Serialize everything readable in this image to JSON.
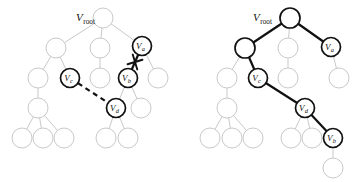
{
  "figure": {
    "title": "",
    "background_color": "#ffffff",
    "faint_node_color": "#c9c9c9",
    "bold_node_color": "#111111",
    "panels": [
      {
        "id": "left-panel",
        "name": "before-reconnection-tree",
        "root_label": "V",
        "root_sub": "root",
        "root_label_x": 76,
        "root_label_y": 21,
        "nodes": [
          {
            "id": "L-root",
            "x": 103,
            "y": 18,
            "r": 10,
            "style": "faint",
            "label": "",
            "sub": ""
          },
          {
            "id": "L-n1",
            "x": 56,
            "y": 48,
            "r": 10,
            "style": "faint",
            "label": "",
            "sub": ""
          },
          {
            "id": "L-n2",
            "x": 100,
            "y": 48,
            "r": 10,
            "style": "faint",
            "label": "",
            "sub": ""
          },
          {
            "id": "L-va",
            "x": 142,
            "y": 46,
            "r": 9.5,
            "style": "bold",
            "label": "V",
            "sub": "a"
          },
          {
            "id": "L-n3",
            "x": 38,
            "y": 78,
            "r": 10,
            "style": "faint",
            "label": "",
            "sub": ""
          },
          {
            "id": "L-vc",
            "x": 70,
            "y": 78,
            "r": 9.5,
            "style": "bold",
            "label": "V",
            "sub": "c"
          },
          {
            "id": "L-n4",
            "x": 100,
            "y": 78,
            "r": 10,
            "style": "faint",
            "label": "",
            "sub": ""
          },
          {
            "id": "L-vb",
            "x": 128,
            "y": 78,
            "r": 9.5,
            "style": "bold",
            "label": "V",
            "sub": "b"
          },
          {
            "id": "L-n5",
            "x": 158,
            "y": 78,
            "r": 10,
            "style": "faint",
            "label": "",
            "sub": ""
          },
          {
            "id": "L-n6",
            "x": 38,
            "y": 108,
            "r": 10,
            "style": "faint",
            "label": "",
            "sub": ""
          },
          {
            "id": "L-vd",
            "x": 116,
            "y": 108,
            "r": 9.5,
            "style": "bold",
            "label": "V",
            "sub": "d"
          },
          {
            "id": "L-n7",
            "x": 141,
            "y": 108,
            "r": 10,
            "style": "faint",
            "label": "",
            "sub": ""
          },
          {
            "id": "L-n8",
            "x": 22,
            "y": 138,
            "r": 10,
            "style": "faint",
            "label": "",
            "sub": ""
          },
          {
            "id": "L-n9",
            "x": 43,
            "y": 138,
            "r": 10,
            "style": "faint",
            "label": "",
            "sub": ""
          },
          {
            "id": "L-n10",
            "x": 64,
            "y": 138,
            "r": 10,
            "style": "faint",
            "label": "",
            "sub": ""
          },
          {
            "id": "L-n11",
            "x": 106,
            "y": 138,
            "r": 10,
            "style": "faint",
            "label": "",
            "sub": ""
          },
          {
            "id": "L-n12",
            "x": 128,
            "y": 138,
            "r": 10,
            "style": "faint",
            "label": "",
            "sub": ""
          }
        ],
        "edges": [
          {
            "from": "L-root",
            "to": "L-n1",
            "style": "faint"
          },
          {
            "from": "L-root",
            "to": "L-n2",
            "style": "faint"
          },
          {
            "from": "L-root",
            "to": "L-va",
            "style": "faint"
          },
          {
            "from": "L-n1",
            "to": "L-n3",
            "style": "faint"
          },
          {
            "from": "L-n1",
            "to": "L-vc",
            "style": "faint"
          },
          {
            "from": "L-n2",
            "to": "L-n4",
            "style": "faint"
          },
          {
            "from": "L-va",
            "to": "L-vb",
            "style": "bold"
          },
          {
            "from": "L-va",
            "to": "L-n5",
            "style": "faint"
          },
          {
            "from": "L-n3",
            "to": "L-n6",
            "style": "faint"
          },
          {
            "from": "L-vb",
            "to": "L-vd",
            "style": "faint"
          },
          {
            "from": "L-vb",
            "to": "L-n7",
            "style": "faint"
          },
          {
            "from": "L-n6",
            "to": "L-n8",
            "style": "faint"
          },
          {
            "from": "L-n6",
            "to": "L-n9",
            "style": "faint"
          },
          {
            "from": "L-n6",
            "to": "L-n10",
            "style": "faint"
          },
          {
            "from": "L-vd",
            "to": "L-n11",
            "style": "faint"
          },
          {
            "from": "L-vd",
            "to": "L-n12",
            "style": "faint"
          }
        ],
        "dashed_edges": [
          {
            "from": "L-vc",
            "to": "L-vd",
            "style": "dashed-bold"
          }
        ],
        "cut_marks": [
          {
            "name": "edge-cut-mark",
            "x": 135,
            "y": 62,
            "size": 5.5,
            "angle": 28
          }
        ]
      },
      {
        "id": "right-panel",
        "name": "after-reconnection-tree",
        "root_label": "V",
        "root_sub": "root",
        "root_label_x": 253,
        "root_label_y": 21,
        "nodes": [
          {
            "id": "R-root",
            "x": 290,
            "y": 18,
            "r": 10,
            "style": "bold",
            "label": "",
            "sub": ""
          },
          {
            "id": "R-n1",
            "x": 245,
            "y": 48,
            "r": 10,
            "style": "bold",
            "label": "",
            "sub": ""
          },
          {
            "id": "R-n2",
            "x": 288,
            "y": 48,
            "r": 10,
            "style": "faint",
            "label": "",
            "sub": ""
          },
          {
            "id": "R-va",
            "x": 331,
            "y": 47,
            "r": 9.5,
            "style": "bold",
            "label": "V",
            "sub": "a"
          },
          {
            "id": "R-n3",
            "x": 227,
            "y": 78,
            "r": 10,
            "style": "faint",
            "label": "",
            "sub": ""
          },
          {
            "id": "R-vc",
            "x": 258,
            "y": 78,
            "r": 9.5,
            "style": "bold",
            "label": "V",
            "sub": "c"
          },
          {
            "id": "R-n4",
            "x": 288,
            "y": 78,
            "r": 10,
            "style": "faint",
            "label": "",
            "sub": ""
          },
          {
            "id": "R-n5",
            "x": 339,
            "y": 78,
            "r": 10,
            "style": "faint",
            "label": "",
            "sub": ""
          },
          {
            "id": "R-n6",
            "x": 227,
            "y": 108,
            "r": 10,
            "style": "faint",
            "label": "",
            "sub": ""
          },
          {
            "id": "R-vd",
            "x": 305,
            "y": 108,
            "r": 9.5,
            "style": "bold",
            "label": "V",
            "sub": "d"
          },
          {
            "id": "R-n8",
            "x": 210,
            "y": 138,
            "r": 10,
            "style": "faint",
            "label": "",
            "sub": ""
          },
          {
            "id": "R-n9",
            "x": 232,
            "y": 138,
            "r": 10,
            "style": "faint",
            "label": "",
            "sub": ""
          },
          {
            "id": "R-n10",
            "x": 253,
            "y": 138,
            "r": 10,
            "style": "faint",
            "label": "",
            "sub": ""
          },
          {
            "id": "R-n11",
            "x": 291,
            "y": 138,
            "r": 10,
            "style": "faint",
            "label": "",
            "sub": ""
          },
          {
            "id": "R-n12",
            "x": 312,
            "y": 138,
            "r": 10,
            "style": "faint",
            "label": "",
            "sub": ""
          },
          {
            "id": "R-vb",
            "x": 333,
            "y": 138,
            "r": 9.5,
            "style": "bold",
            "label": "V",
            "sub": "b"
          },
          {
            "id": "R-n13",
            "x": 333,
            "y": 168,
            "r": 10,
            "style": "faint",
            "label": "",
            "sub": ""
          }
        ],
        "edges": [
          {
            "from": "R-root",
            "to": "R-n1",
            "style": "bold"
          },
          {
            "from": "R-root",
            "to": "R-n2",
            "style": "faint"
          },
          {
            "from": "R-root",
            "to": "R-va",
            "style": "bold"
          },
          {
            "from": "R-n1",
            "to": "R-n3",
            "style": "faint"
          },
          {
            "from": "R-n1",
            "to": "R-vc",
            "style": "bold"
          },
          {
            "from": "R-n2",
            "to": "R-n4",
            "style": "faint"
          },
          {
            "from": "R-va",
            "to": "R-n5",
            "style": "faint"
          },
          {
            "from": "R-n3",
            "to": "R-n6",
            "style": "faint"
          },
          {
            "from": "R-vc",
            "to": "R-vd",
            "style": "bold"
          },
          {
            "from": "R-n6",
            "to": "R-n8",
            "style": "faint"
          },
          {
            "from": "R-n6",
            "to": "R-n9",
            "style": "faint"
          },
          {
            "from": "R-n6",
            "to": "R-n10",
            "style": "faint"
          },
          {
            "from": "R-vd",
            "to": "R-n11",
            "style": "faint"
          },
          {
            "from": "R-vd",
            "to": "R-n12",
            "style": "faint"
          },
          {
            "from": "R-vd",
            "to": "R-vb",
            "style": "bold"
          },
          {
            "from": "R-vb",
            "to": "R-n13",
            "style": "faint"
          }
        ],
        "dashed_edges": [],
        "cut_marks": []
      }
    ]
  }
}
